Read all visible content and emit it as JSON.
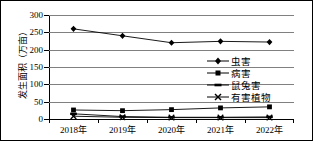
{
  "chart_data": {
    "type": "line",
    "title": "",
    "xlabel": "",
    "ylabel": "发生面积（万亩）",
    "categories": [
      "2018年",
      "2019年",
      "2020年",
      "2021年",
      "2022年"
    ],
    "ylim": [
      0,
      300
    ],
    "yticks": [
      0,
      50,
      100,
      150,
      200,
      250,
      300
    ],
    "ytick_labels": [
      "0",
      "50",
      "100",
      "150",
      "200",
      "250",
      "300"
    ],
    "grid": true,
    "legend_position": "right",
    "series": [
      {
        "name": "虫害",
        "marker": "diamond",
        "color": "#000000",
        "values": [
          260,
          240,
          220,
          224,
          222
        ]
      },
      {
        "name": "病害",
        "marker": "square",
        "color": "#000000",
        "values": [
          26,
          24,
          27,
          32,
          35
        ]
      },
      {
        "name": "鼠兔害",
        "marker": "dash",
        "color": "#000000",
        "values": [
          15,
          7,
          5,
          5,
          6
        ]
      },
      {
        "name": "有害植物",
        "marker": "cross",
        "color": "#000000",
        "values": [
          8,
          5,
          4,
          4,
          4
        ]
      }
    ]
  },
  "figure": {
    "border_color": "#000000",
    "background": "#ffffff",
    "grid_color": "#808080"
  }
}
